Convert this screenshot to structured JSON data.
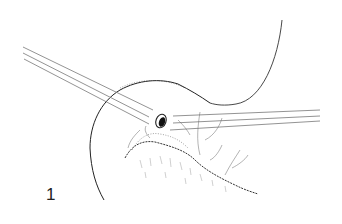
{
  "figure": {
    "number_label": "1"
  },
  "colors": {
    "background": "#ffffff",
    "ink": "#222222",
    "line_gray": "#777777",
    "stipple": "#555555"
  }
}
